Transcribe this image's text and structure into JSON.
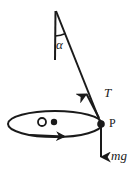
{
  "figure": {
    "stroke_color": "#1a1a1a",
    "background_color": "#ffffff",
    "labels": {
      "angle": "α",
      "tension": "T",
      "bob": "P",
      "weight": "mg"
    },
    "elements": {
      "pivot_label": "pivot",
      "vertical_axis_label": "vertical-reference-line",
      "string_label": "pendulum-string",
      "circular_path_label": "horizontal-circular-path",
      "motion_arrow_label": "direction-of-motion",
      "center_marker_label": "circle-center",
      "axis_marker_label": "axis-point"
    },
    "geometry": {
      "pivot": [
        56,
        11
      ],
      "bob": [
        101,
        124
      ],
      "vertical_line_end": [
        55,
        60
      ],
      "ellipse_center": [
        55,
        124
      ],
      "ellipse_rx": 47,
      "ellipse_ry": 13,
      "weight_arrow_end": [
        101,
        160
      ],
      "tension_arrow_tip": [
        85,
        92
      ],
      "open_circle_center": [
        42,
        122
      ],
      "open_circle_r": 4,
      "center_dot": [
        54,
        122
      ],
      "center_dot_r": 3
    }
  }
}
